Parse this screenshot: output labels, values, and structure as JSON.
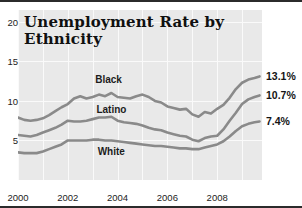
{
  "chart_data": {
    "type": "line",
    "title": "Unemployment Rate by Ethnicity",
    "title_line1": "Unemployment Rate by",
    "title_line2": "Ethnicity",
    "xlabel": "",
    "ylabel": "",
    "xlim": [
      2000.0,
      2009.8
    ],
    "ylim": [
      0,
      21.5
    ],
    "yticks": [
      20,
      15,
      10,
      5
    ],
    "xticks": [
      2000,
      2002,
      2004,
      2006,
      2008
    ],
    "grid": true,
    "legend_position": "inline",
    "line_color": "#8a8a8a",
    "panel_color": "#e9e9e9",
    "gridline_color": "#fafafa",
    "series": [
      {
        "name": "Black",
        "label_x": 2003.1,
        "label_y": 12.6,
        "end_label": "13.1%",
        "end_value": 13.1,
        "x": [
          2000.0,
          2000.25,
          2000.5,
          2000.75,
          2001.0,
          2001.25,
          2001.5,
          2001.75,
          2002.0,
          2002.25,
          2002.5,
          2002.75,
          2003.0,
          2003.25,
          2003.5,
          2003.75,
          2004.0,
          2004.25,
          2004.5,
          2004.75,
          2005.0,
          2005.25,
          2005.5,
          2005.75,
          2006.0,
          2006.25,
          2006.5,
          2006.75,
          2007.0,
          2007.25,
          2007.5,
          2007.75,
          2008.0,
          2008.25,
          2008.5,
          2008.75,
          2009.0,
          2009.25,
          2009.5,
          2009.7
        ],
        "values": [
          7.9,
          7.6,
          7.5,
          7.6,
          7.8,
          8.2,
          8.7,
          9.2,
          9.6,
          10.3,
          10.6,
          10.3,
          10.5,
          10.8,
          10.6,
          11.0,
          10.5,
          10.4,
          10.3,
          10.6,
          10.8,
          10.5,
          10.0,
          9.8,
          9.3,
          9.1,
          8.9,
          9.0,
          8.3,
          8.0,
          8.6,
          8.4,
          9.0,
          9.5,
          10.4,
          11.5,
          12.3,
          12.7,
          12.9,
          13.1
        ]
      },
      {
        "name": "Latino",
        "label_x": 2003.15,
        "label_y": 8.9,
        "end_label": "10.7%",
        "end_value": 10.7,
        "x": [
          2000.0,
          2000.25,
          2000.5,
          2000.75,
          2001.0,
          2001.25,
          2001.5,
          2001.75,
          2002.0,
          2002.25,
          2002.5,
          2002.75,
          2003.0,
          2003.25,
          2003.5,
          2003.75,
          2004.0,
          2004.25,
          2004.5,
          2004.75,
          2005.0,
          2005.25,
          2005.5,
          2005.75,
          2006.0,
          2006.25,
          2006.5,
          2006.75,
          2007.0,
          2007.25,
          2007.5,
          2007.75,
          2008.0,
          2008.25,
          2008.5,
          2008.75,
          2009.0,
          2009.25,
          2009.5,
          2009.7
        ],
        "values": [
          5.7,
          5.6,
          5.5,
          5.7,
          6.0,
          6.3,
          6.6,
          7.0,
          7.5,
          7.4,
          7.4,
          7.5,
          7.7,
          7.9,
          7.9,
          8.0,
          7.5,
          7.3,
          7.2,
          7.1,
          6.9,
          6.6,
          6.4,
          6.3,
          6.0,
          5.8,
          5.6,
          5.5,
          5.1,
          4.9,
          5.3,
          5.5,
          5.6,
          6.4,
          7.5,
          8.5,
          9.6,
          10.2,
          10.5,
          10.7
        ]
      },
      {
        "name": "White",
        "label_x": 2003.2,
        "label_y": 3.6,
        "end_label": "7.4%",
        "end_value": 7.4,
        "x": [
          2000.0,
          2000.25,
          2000.5,
          2000.75,
          2001.0,
          2001.25,
          2001.5,
          2001.75,
          2002.0,
          2002.25,
          2002.5,
          2002.75,
          2003.0,
          2003.25,
          2003.5,
          2003.75,
          2004.0,
          2004.25,
          2004.5,
          2004.75,
          2005.0,
          2005.25,
          2005.5,
          2005.75,
          2006.0,
          2006.25,
          2006.5,
          2006.75,
          2007.0,
          2007.25,
          2007.5,
          2007.75,
          2008.0,
          2008.25,
          2008.5,
          2008.75,
          2009.0,
          2009.25,
          2009.5,
          2009.7
        ],
        "values": [
          3.5,
          3.4,
          3.4,
          3.4,
          3.6,
          3.9,
          4.2,
          4.5,
          5.0,
          5.0,
          5.0,
          5.0,
          5.1,
          5.1,
          5.0,
          5.0,
          4.9,
          4.8,
          4.7,
          4.6,
          4.5,
          4.4,
          4.3,
          4.3,
          4.2,
          4.1,
          4.0,
          4.0,
          3.9,
          3.9,
          4.1,
          4.3,
          4.5,
          4.9,
          5.5,
          6.2,
          6.8,
          7.1,
          7.3,
          7.4
        ]
      }
    ]
  }
}
